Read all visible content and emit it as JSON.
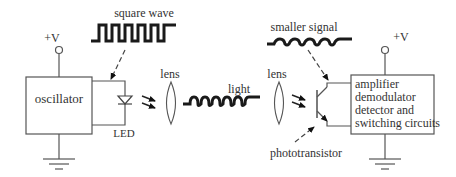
{
  "diagram": {
    "labels": {
      "square_wave": "square wave",
      "smaller_signal": "smaller signal",
      "supply_left": "+V",
      "supply_right": "+V",
      "oscillator": "oscillator",
      "led": "LED",
      "lens_left": "lens",
      "lens_right": "lens",
      "light": "light",
      "phototransistor": "phototransistor",
      "receiver_lines": [
        "amplifier",
        "demodulator",
        "detector and",
        "switching circuits"
      ]
    },
    "colors": {
      "line": "#555555",
      "wave": "#1a1a1a",
      "text": "#333333",
      "background": "#ffffff"
    }
  }
}
